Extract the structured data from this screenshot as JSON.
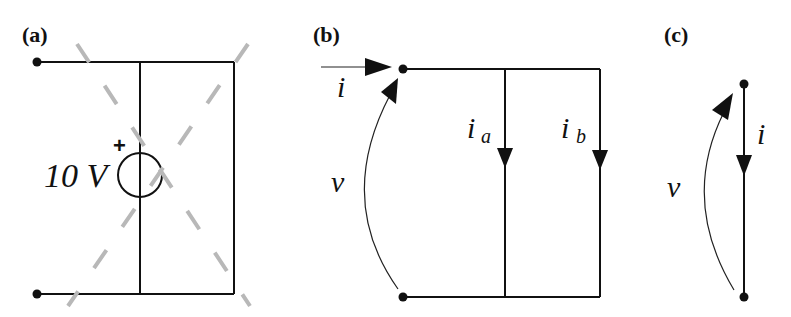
{
  "figure": {
    "panels": [
      {
        "id": "a",
        "label": "(a)",
        "source": {
          "value_label": "10 V",
          "polarity_mark": "+"
        },
        "crossed_out": true,
        "cross_color": "#b8b8b8"
      },
      {
        "id": "b",
        "label": "(b)",
        "current_in": "i",
        "branch_currents": [
          {
            "symbol": "i",
            "subscript": "a"
          },
          {
            "symbol": "i",
            "subscript": "b"
          }
        ],
        "voltage": "v"
      },
      {
        "id": "c",
        "label": "(c)",
        "current": "i",
        "voltage": "v"
      }
    ]
  }
}
